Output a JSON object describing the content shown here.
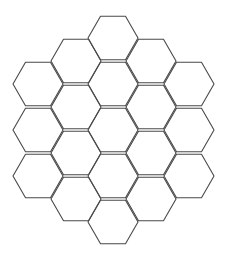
{
  "diagram": {
    "type": "hexagonal-grid",
    "orientation": "flat-top",
    "layout": "hexagon of hexagons, radius 2",
    "cell_count": 19,
    "line_color": "#4a4a4a",
    "background": "#ffffff",
    "hex_radius": 25,
    "columns": [
      {
        "cx": 38,
        "cy": [
          84,
          130,
          176
        ]
      },
      {
        "cx": 76,
        "cy": [
          61,
          107,
          153,
          199
        ]
      },
      {
        "cx": 113,
        "cy": [
          38,
          84,
          130,
          176,
          222
        ]
      },
      {
        "cx": 151,
        "cy": [
          61,
          107,
          153,
          199
        ]
      },
      {
        "cx": 189,
        "cy": [
          84,
          130,
          176
        ]
      }
    ]
  }
}
